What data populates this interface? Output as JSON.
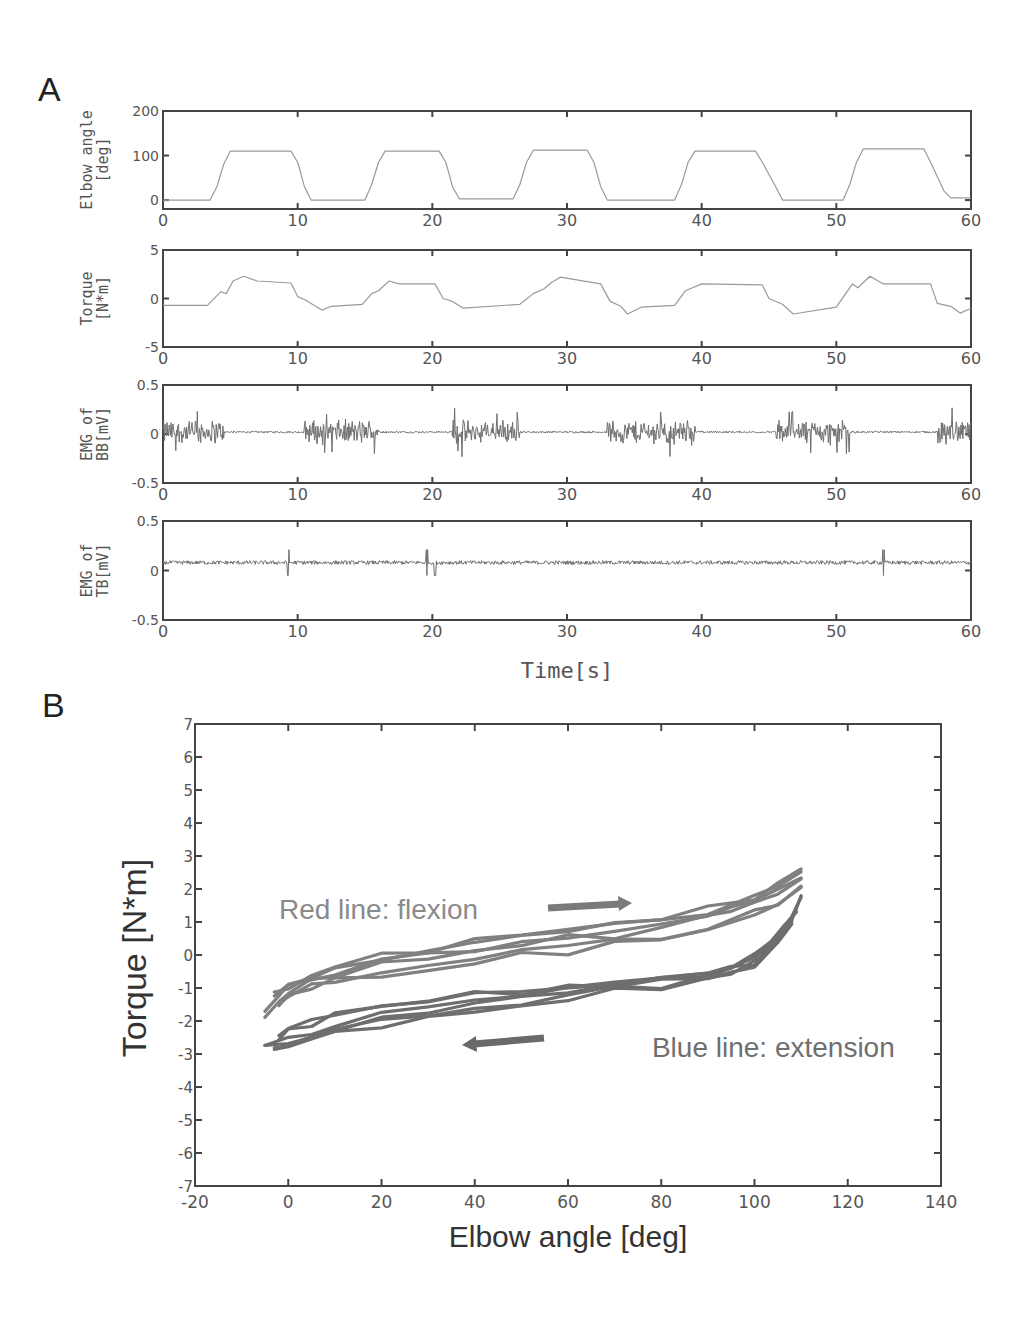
{
  "panels": {
    "a_label": "A",
    "b_label": "B"
  },
  "chart_data": [
    {
      "id": "A1",
      "type": "line",
      "title": "",
      "ylabel_line1": "Elbow angle",
      "ylabel_line2": "[deg]",
      "xlabel": "",
      "xlim": [
        0,
        60
      ],
      "ylim": [
        -20,
        200
      ],
      "xticks": [
        0,
        10,
        20,
        30,
        40,
        50,
        60
      ],
      "yticks": [
        0,
        100,
        200
      ],
      "ytick_labels": [
        "0",
        "100",
        "200"
      ],
      "grid": false,
      "x": [
        0,
        3.5,
        4,
        4.5,
        5,
        9.5,
        10,
        10.5,
        11,
        15,
        15.5,
        16,
        16.5,
        20.5,
        21,
        21.5,
        22,
        26,
        26.5,
        27,
        27.5,
        31.5,
        32,
        32.5,
        33,
        38,
        38.5,
        39,
        39.5,
        44,
        44.5,
        45.5,
        46,
        50.5,
        51,
        51.5,
        52,
        56.5,
        57,
        58,
        58.5,
        60
      ],
      "values": [
        0,
        0,
        30,
        80,
        110,
        110,
        85,
        30,
        0,
        0,
        35,
        85,
        110,
        110,
        85,
        30,
        3,
        3,
        35,
        85,
        112,
        112,
        85,
        30,
        0,
        0,
        35,
        85,
        110,
        110,
        85,
        30,
        0,
        0,
        35,
        85,
        115,
        115,
        85,
        20,
        5,
        5
      ]
    },
    {
      "id": "A2",
      "type": "line",
      "ylabel_line1": "Torque",
      "ylabel_line2": "[N*m]",
      "xlabel": "",
      "xlim": [
        0,
        60
      ],
      "ylim": [
        -5,
        5
      ],
      "xticks": [
        0,
        10,
        20,
        30,
        40,
        50,
        60
      ],
      "yticks": [
        -5,
        0,
        5
      ],
      "ytick_labels": [
        "-5",
        "0",
        "5"
      ],
      "grid": false,
      "x": [
        0,
        3.3,
        4.3,
        4.7,
        5.2,
        6,
        7,
        9.5,
        10,
        10.5,
        11,
        11.8,
        12.5,
        14.8,
        15.5,
        16,
        16.8,
        17.5,
        20.2,
        20.8,
        21.5,
        22.3,
        26.5,
        27.5,
        28.3,
        28.8,
        29.5,
        32.5,
        33.2,
        34,
        34.5,
        35.5,
        38,
        38.8,
        40,
        44.5,
        45,
        46,
        46.8,
        50,
        51.2,
        51.6,
        52.5,
        53.5,
        57,
        57.5,
        58.5,
        59.2,
        60
      ],
      "values": [
        -0.7,
        -0.7,
        0.7,
        0.5,
        1.8,
        2.3,
        1.8,
        1.6,
        0.2,
        -0.1,
        -0.5,
        -1.2,
        -0.8,
        -0.6,
        0.5,
        0.8,
        1.8,
        1.5,
        1.5,
        0.0,
        -0.3,
        -1.0,
        -0.6,
        0.5,
        1.0,
        1.6,
        2.2,
        1.5,
        -0.3,
        -0.8,
        -1.6,
        -0.9,
        -0.7,
        0.8,
        1.5,
        1.4,
        0.0,
        -0.6,
        -1.6,
        -0.9,
        1.5,
        1.1,
        2.3,
        1.5,
        1.5,
        -0.5,
        -0.8,
        -1.5,
        -1.0
      ]
    },
    {
      "id": "A3",
      "type": "line",
      "ylabel_line1": "EMG of",
      "ylabel_line2": "BB[mV]",
      "xlabel": "",
      "xlim": [
        0,
        60
      ],
      "ylim": [
        -0.5,
        0.5
      ],
      "xticks": [
        0,
        10,
        20,
        30,
        40,
        50,
        60
      ],
      "yticks": [
        -0.5,
        0,
        0.5
      ],
      "ytick_labels": [
        "-0.5",
        "0",
        "0.5"
      ],
      "grid": false,
      "baseline": 0.02,
      "active_bursts_s": [
        [
          0,
          4.5
        ],
        [
          10.5,
          16
        ],
        [
          21.5,
          26.5
        ],
        [
          33,
          39.5
        ],
        [
          45.5,
          51
        ],
        [
          57.5,
          60
        ]
      ],
      "burst_amplitude_mV": 0.12,
      "rest_amplitude_mV": 0.01
    },
    {
      "id": "A4",
      "type": "line",
      "ylabel_line1": "EMG of",
      "ylabel_line2": "TB[mV]",
      "xlabel": "Time[s]",
      "xlim": [
        0,
        60
      ],
      "ylim": [
        -0.5,
        0.5
      ],
      "xticks": [
        0,
        10,
        20,
        30,
        40,
        50,
        60
      ],
      "yticks": [
        -0.5,
        0,
        0.5
      ],
      "ytick_labels": [
        "-0.5",
        "0",
        "0.5"
      ],
      "grid": false,
      "baseline": 0.08,
      "noise_amplitude_mV": 0.02,
      "spikes_s": [
        9.3,
        19.6,
        20.2,
        53.5
      ]
    },
    {
      "id": "B",
      "type": "line",
      "title": "",
      "xlabel": "Elbow angle [deg]",
      "ylabel": "Torque [N*m]",
      "xlim": [
        -20,
        140
      ],
      "ylim": [
        -7,
        7
      ],
      "xticks": [
        -20,
        0,
        20,
        40,
        60,
        80,
        100,
        120,
        140
      ],
      "yticks": [
        -7,
        -6,
        -5,
        -4,
        -3,
        -2,
        -1,
        0,
        1,
        2,
        3,
        4,
        5,
        6,
        7
      ],
      "grid": false,
      "annotations": [
        {
          "text": "Red line: flexion",
          "x": -2,
          "y": 1.4,
          "arrow": "right"
        },
        {
          "text": "Blue line: extension",
          "x": 78,
          "y": -2.8,
          "arrow": "left"
        }
      ],
      "series": [
        {
          "name": "flexion",
          "color": "#808080",
          "x": [
            -5,
            -2,
            0,
            5,
            10,
            20,
            30,
            40,
            50,
            60,
            70,
            80,
            90,
            95,
            100,
            105,
            110
          ],
          "values": [
            -1.9,
            -1.4,
            -1.1,
            -0.8,
            -0.6,
            -0.3,
            -0.1,
            0.1,
            0.3,
            0.5,
            0.6,
            0.8,
            1.1,
            1.3,
            1.6,
            1.9,
            2.3
          ]
        },
        {
          "name": "flexion_2",
          "color": "#808080",
          "x": [
            -3,
            0,
            5,
            10,
            20,
            30,
            40,
            50,
            60,
            70,
            80,
            90,
            100,
            105,
            110
          ],
          "values": [
            -1.3,
            -1.0,
            -0.6,
            -0.4,
            -0.1,
            0.1,
            0.4,
            0.6,
            0.8,
            0.9,
            1.0,
            1.3,
            1.7,
            2.1,
            2.6
          ]
        },
        {
          "name": "flexion_3",
          "color": "#808080",
          "x": [
            -2,
            0,
            5,
            10,
            20,
            30,
            40,
            50,
            60,
            70,
            80,
            90,
            100,
            105,
            110
          ],
          "values": [
            -1.5,
            -1.3,
            -1.0,
            -0.8,
            -0.6,
            -0.4,
            -0.2,
            0.0,
            0.1,
            0.3,
            0.5,
            0.8,
            1.2,
            1.5,
            2.0
          ]
        },
        {
          "name": "extension",
          "color": "#6e6e6e",
          "x": [
            110,
            108,
            105,
            100,
            95,
            90,
            80,
            70,
            60,
            50,
            40,
            30,
            20,
            10,
            5,
            0,
            -5
          ],
          "values": [
            1.7,
            1.0,
            0.5,
            0.0,
            -0.4,
            -0.6,
            -0.8,
            -1.0,
            -1.1,
            -1.3,
            -1.5,
            -1.7,
            -1.9,
            -2.2,
            -2.4,
            -2.6,
            -2.7
          ]
        },
        {
          "name": "extension_2",
          "color": "#6e6e6e",
          "x": [
            109,
            106,
            103,
            100,
            95,
            90,
            80,
            70,
            60,
            50,
            40,
            30,
            20,
            10,
            5,
            0,
            -3
          ],
          "values": [
            1.3,
            0.7,
            0.2,
            -0.2,
            -0.5,
            -0.7,
            -1.0,
            -1.1,
            -1.3,
            -1.5,
            -1.7,
            -1.9,
            -2.1,
            -2.4,
            -2.6,
            -2.8,
            -2.9
          ]
        },
        {
          "name": "extension_3",
          "color": "#6e6e6e",
          "x": [
            108,
            105,
            100,
            95,
            90,
            80,
            70,
            60,
            50,
            40,
            30,
            20,
            10,
            5,
            0,
            -2
          ],
          "values": [
            1.0,
            0.4,
            -0.3,
            -0.5,
            -0.6,
            -0.7,
            -0.9,
            -1.0,
            -1.1,
            -1.2,
            -1.4,
            -1.6,
            -1.8,
            -2.1,
            -2.3,
            -2.5
          ]
        }
      ]
    }
  ]
}
